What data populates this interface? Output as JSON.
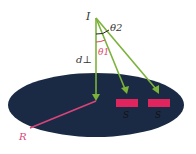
{
  "diagram": {
    "labels": {
      "source": "I",
      "theta2": "θ2",
      "theta1": "θ1",
      "perp_distance": "d⊥",
      "sample1": "S",
      "sample2": "S",
      "radius": "R"
    },
    "colors": {
      "disk": "#1b2a44",
      "ray": "#7bb33a",
      "sample": "#e0245e",
      "radius": "#d9457a",
      "angle_theta1": "#d94a6a",
      "angle_theta2": "#222222",
      "text": "#333333"
    }
  }
}
